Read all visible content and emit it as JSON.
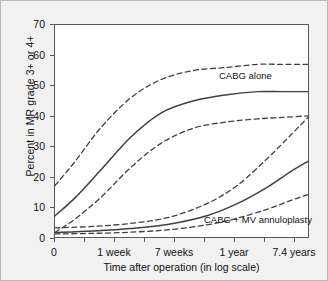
{
  "chart_data": {
    "type": "line",
    "title": "",
    "xlabel": "Time after operation (in log scale)",
    "ylabel": "Percent in MR grade 3+ or 4+",
    "ylim": [
      0,
      70
    ],
    "ytick_values": [
      0,
      10,
      20,
      30,
      40,
      50,
      60,
      70
    ],
    "ytick_labels": [
      "0",
      "10",
      "20",
      "30",
      "40",
      "50",
      "60",
      "70"
    ],
    "xtick_labels": [
      "0",
      "1 week",
      "7 weeks",
      "1 year",
      "7.4 years"
    ],
    "xtick_minor_count": 4,
    "grid": false,
    "legend_position": "inline-annotation",
    "x_log_scale": true,
    "series": [
      {
        "name": "CABG alone",
        "style": "solid",
        "x": [
          0,
          0.08,
          0.18,
          0.3,
          0.42,
          0.55,
          0.68,
          0.8,
          0.9,
          1.0
        ],
        "values": [
          7,
          13,
          22,
          33,
          41,
          45,
          47,
          48,
          48,
          48
        ]
      },
      {
        "name": "CABG alone upper CI",
        "style": "dashed",
        "x": [
          0,
          0.08,
          0.18,
          0.3,
          0.42,
          0.55,
          0.68,
          0.8,
          0.9,
          1.0
        ],
        "values": [
          17,
          25,
          36,
          46,
          52,
          55,
          56,
          57,
          57,
          57
        ]
      },
      {
        "name": "CABG alone lower CI",
        "style": "dashed",
        "x": [
          0,
          0.08,
          0.18,
          0.3,
          0.42,
          0.55,
          0.68,
          0.8,
          0.9,
          1.0
        ],
        "values": [
          1.5,
          6,
          13,
          23,
          31,
          36,
          38,
          39,
          39.5,
          40
        ]
      },
      {
        "name": "CABG + MV annuloplasty",
        "style": "solid",
        "x": [
          0,
          0.15,
          0.3,
          0.45,
          0.6,
          0.72,
          0.84,
          0.93,
          1.0
        ],
        "values": [
          1.5,
          2,
          2.8,
          4.2,
          7,
          11,
          16.5,
          21.5,
          25
        ]
      },
      {
        "name": "CABG + MV annuloplasty upper CI",
        "style": "dashed",
        "x": [
          0,
          0.15,
          0.3,
          0.45,
          0.6,
          0.72,
          0.84,
          0.93,
          1.0
        ],
        "values": [
          3,
          3.5,
          4.5,
          6.5,
          11,
          17,
          26,
          33.5,
          39.5
        ]
      },
      {
        "name": "CABG + MV annuloplasty lower CI",
        "style": "dashed",
        "x": [
          0,
          0.15,
          0.3,
          0.45,
          0.6,
          0.72,
          0.84,
          0.93,
          1.0
        ],
        "values": [
          1,
          1.2,
          1.6,
          2.4,
          4,
          6.2,
          9.2,
          12,
          14
        ]
      }
    ],
    "annotations": [
      {
        "text": "CABG alone",
        "x_px": 218,
        "y_px": 69
      },
      {
        "text": "CABG + MV annuloplasty",
        "x_px": 203,
        "y_px": 213
      }
    ],
    "colors": {
      "curve": "#3f3f3f",
      "axis": "#5a5a5a",
      "page_background": "#f1f1f1",
      "plot_background": "#ffffff",
      "text": "#111111"
    }
  }
}
